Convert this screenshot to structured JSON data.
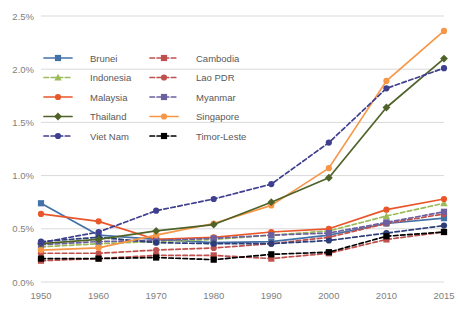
{
  "chart_data": {
    "type": "line",
    "title": "",
    "xlabel": "",
    "ylabel": "",
    "categories": [
      "1950",
      "1960",
      "1970",
      "1980",
      "1990",
      "2000",
      "2010",
      "2015"
    ],
    "ylim": [
      0.0,
      2.5
    ],
    "ytick_labels": [
      "0.0%",
      "0.5%",
      "1.0%",
      "1.5%",
      "2.0%",
      "2.5%"
    ],
    "ytick_values": [
      0.0,
      0.5,
      1.0,
      1.5,
      2.0,
      2.5
    ],
    "grid": true,
    "grid_axis": "y",
    "legend_position": "inside-upper-left",
    "series": [
      {
        "name": "Brunei",
        "color": "#4472a8",
        "dash": "solid",
        "marker": "square",
        "values": [
          0.74,
          0.44,
          0.4,
          0.37,
          0.38,
          0.44,
          0.55,
          0.6
        ]
      },
      {
        "name": "Cambodia",
        "color": "#c0504d",
        "dash": "dashed",
        "marker": "square",
        "values": [
          0.2,
          0.22,
          0.25,
          0.25,
          0.22,
          0.27,
          0.4,
          0.47
        ]
      },
      {
        "name": "Indonesia",
        "color": "#9bbb59",
        "dash": "dashed",
        "marker": "triangle",
        "values": [
          0.33,
          0.36,
          0.38,
          0.4,
          0.44,
          0.48,
          0.62,
          0.74
        ]
      },
      {
        "name": "Lao PDR",
        "color": "#c0504d",
        "dash": "dashed",
        "marker": "circle",
        "values": [
          0.27,
          0.27,
          0.3,
          0.32,
          0.36,
          0.42,
          0.55,
          0.64
        ]
      },
      {
        "name": "Malaysia",
        "color": "#e8562a",
        "dash": "solid",
        "marker": "circle",
        "values": [
          0.64,
          0.57,
          0.4,
          0.42,
          0.47,
          0.5,
          0.68,
          0.78
        ]
      },
      {
        "name": "Myanmar",
        "color": "#6c5fa0",
        "dash": "dashed",
        "marker": "square",
        "values": [
          0.35,
          0.38,
          0.39,
          0.41,
          0.44,
          0.46,
          0.56,
          0.66
        ]
      },
      {
        "name": "Philippines",
        "color": "#2c3e7a",
        "dash": "dashed",
        "marker": "circle",
        "values": [
          0.38,
          0.42,
          0.37,
          0.36,
          0.36,
          0.39,
          0.46,
          0.53
        ]
      },
      {
        "name": "Singapore",
        "color": "#f79646",
        "dash": "solid",
        "marker": "circle",
        "values": [
          0.3,
          0.32,
          0.44,
          0.55,
          0.72,
          1.07,
          1.89,
          2.36
        ]
      },
      {
        "name": "Thailand",
        "color": "#4f6228",
        "dash": "solid",
        "marker": "diamond",
        "values": [
          0.36,
          0.4,
          0.48,
          0.54,
          0.75,
          0.98,
          1.64,
          2.1
        ]
      },
      {
        "name": "Timor-Leste",
        "color": "#000000",
        "dash": "dashed",
        "marker": "square",
        "values": [
          0.22,
          0.22,
          0.23,
          0.21,
          0.26,
          0.28,
          0.43,
          0.47
        ]
      },
      {
        "name": "Viet Nam",
        "color": "#3f3f8f",
        "dash": "dashed",
        "marker": "circle",
        "values": [
          0.37,
          0.47,
          0.67,
          0.78,
          0.92,
          1.31,
          1.82,
          2.01
        ]
      }
    ]
  },
  "legend": {
    "columns": [
      [
        "Brunei",
        "Indonesia",
        "Malaysia",
        "Thailand",
        "Viet Nam"
      ],
      [
        "Cambodia",
        "Lao PDR",
        "Myanmar",
        "Singapore",
        "Timor-Leste"
      ]
    ]
  }
}
